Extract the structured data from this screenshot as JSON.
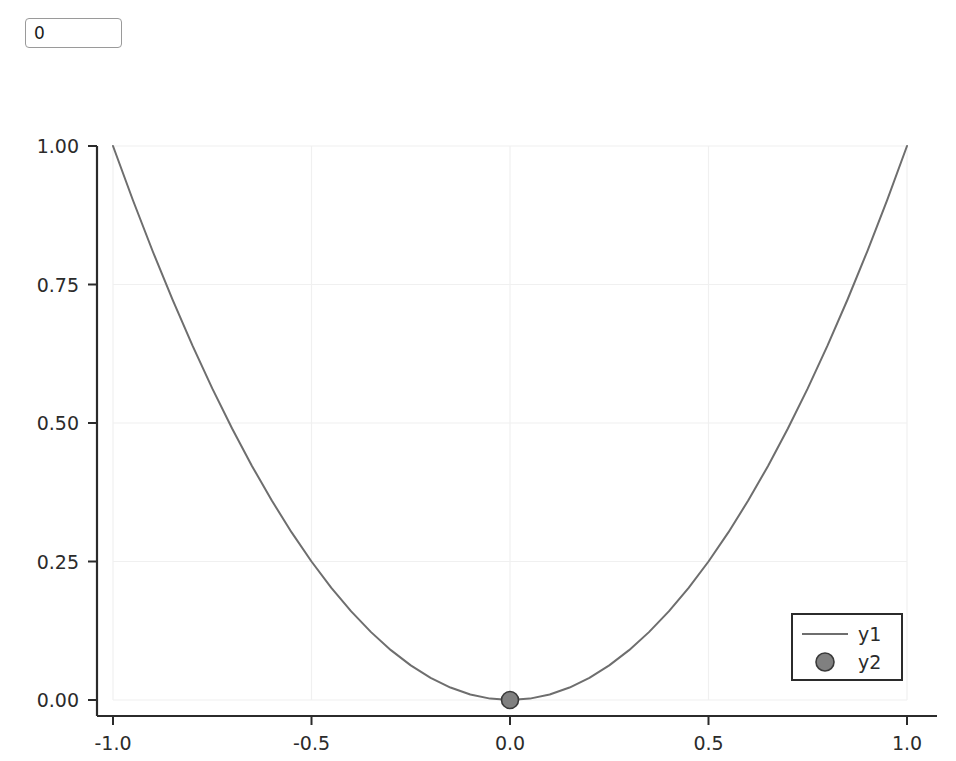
{
  "widget": {
    "number_input": {
      "name": "numeric-entry",
      "value": "0",
      "placeholder": "0"
    }
  },
  "colors": {
    "series_line": "#6e6e6e",
    "marker_fill": "#808080",
    "marker_stroke": "#3a3a3a",
    "axis": "#2b2b2b",
    "grid": "#f0f0f0",
    "text": "#2b2b2b",
    "background": "#ffffff",
    "input_border": "#9a9a9a"
  },
  "chart_data": {
    "type": "line",
    "title": "",
    "xlabel": "",
    "ylabel": "",
    "xlim": [
      -1.0,
      1.0
    ],
    "ylim": [
      0.0,
      1.0
    ],
    "grid": true,
    "legend_position": "bottom-right",
    "xticks": {
      "values": [
        -1.0,
        -0.5,
        0.0,
        0.5,
        1.0
      ],
      "labels": [
        "-1.0",
        "-0.5",
        "0.0",
        "0.5",
        "1.0"
      ]
    },
    "yticks": {
      "values": [
        0.0,
        0.25,
        0.5,
        0.75,
        1.0
      ],
      "labels": [
        "0.00",
        "0.25",
        "0.50",
        "0.75",
        "1.00"
      ]
    },
    "series": [
      {
        "name": "y1",
        "kind": "line",
        "legend_label": "y1",
        "color": "#6e6e6e",
        "x": [
          -1.0,
          -0.95,
          -0.9,
          -0.85,
          -0.8,
          -0.75,
          -0.7,
          -0.65,
          -0.6,
          -0.55,
          -0.5,
          -0.45,
          -0.4,
          -0.35,
          -0.3,
          -0.25,
          -0.2,
          -0.15,
          -0.1,
          -0.05,
          0.0,
          0.05,
          0.1,
          0.15,
          0.2,
          0.25,
          0.3,
          0.35,
          0.4,
          0.45,
          0.5,
          0.55,
          0.6,
          0.65,
          0.7,
          0.75,
          0.8,
          0.85,
          0.9,
          0.95,
          1.0
        ],
        "values": [
          1.0,
          0.9025,
          0.81,
          0.7225,
          0.64,
          0.5625,
          0.49,
          0.4225,
          0.36,
          0.3025,
          0.25,
          0.2025,
          0.16,
          0.1225,
          0.09,
          0.0625,
          0.04,
          0.0225,
          0.01,
          0.0025,
          0.0,
          0.0025,
          0.01,
          0.0225,
          0.04,
          0.0625,
          0.09,
          0.1225,
          0.16,
          0.2025,
          0.25,
          0.3025,
          0.36,
          0.4225,
          0.49,
          0.5625,
          0.64,
          0.7225,
          0.81,
          0.9025,
          1.0
        ]
      },
      {
        "name": "y2",
        "kind": "scatter",
        "legend_label": "y2",
        "color": "#808080",
        "x": [
          0.0
        ],
        "values": [
          0.0
        ]
      }
    ],
    "legend_entries": [
      {
        "label": "y1",
        "marker": "line",
        "color": "#6e6e6e"
      },
      {
        "label": "y2",
        "marker": "circle",
        "color": "#808080"
      }
    ]
  }
}
